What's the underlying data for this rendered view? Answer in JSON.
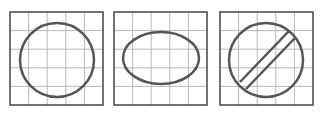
{
  "diagram": {
    "colors": {
      "grid": "#b8b8b8",
      "border": "#444444",
      "shape": "#555555",
      "background": "#ffffff"
    },
    "panels": [
      {
        "id": "panel-1",
        "shape": "circle",
        "x": 10,
        "y": 12,
        "size": 93,
        "cells": 5
      },
      {
        "id": "panel-2",
        "shape": "ellipse",
        "x": 114,
        "y": 12,
        "size": 93,
        "cells": 5
      },
      {
        "id": "panel-3",
        "shape": "circle-with-diagonal-bar",
        "x": 220,
        "y": 12,
        "size": 93,
        "cells": 5
      }
    ]
  }
}
